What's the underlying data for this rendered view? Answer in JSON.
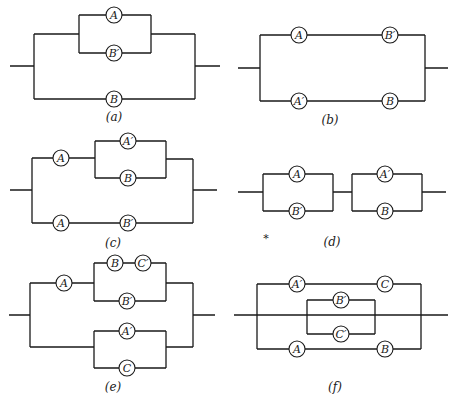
{
  "figure": {
    "stroke_color": "#1a1a1a",
    "background": "#ffffff"
  },
  "circuits": [
    {
      "id": "a",
      "caption": "(a)",
      "structure": "parallel( parallel(A, B'), B )",
      "switches": [
        {
          "label": "A",
          "x": 114,
          "y": 15
        },
        {
          "label": "B′",
          "x": 114,
          "y": 53
        },
        {
          "label": "B",
          "x": 114,
          "y": 99
        }
      ]
    },
    {
      "id": "b",
      "caption": "(b)",
      "structure": "parallel( series(A, B'), series(A', B) )",
      "switches": [
        {
          "label": "A",
          "x": 299,
          "y": 35
        },
        {
          "label": "B′",
          "x": 390,
          "y": 35
        },
        {
          "label": "A′",
          "x": 299,
          "y": 101
        },
        {
          "label": "B",
          "x": 390,
          "y": 101
        }
      ]
    },
    {
      "id": "c",
      "caption": "(c)",
      "structure": "parallel( series(A, parallel(A', B)), series(A, B') )",
      "switches": [
        {
          "label": "A",
          "x": 61,
          "y": 160
        },
        {
          "label": "A′",
          "x": 128,
          "y": 141
        },
        {
          "label": "B",
          "x": 128,
          "y": 178
        },
        {
          "label": "A",
          "x": 61,
          "y": 223
        },
        {
          "label": "B′",
          "x": 128,
          "y": 223
        }
      ]
    },
    {
      "id": "d",
      "caption": "(d)",
      "structure": "series( parallel(A, B'), parallel(A', B) )",
      "switches": [
        {
          "label": "A",
          "x": 297,
          "y": 174
        },
        {
          "label": "B′",
          "x": 297,
          "y": 211
        },
        {
          "label": "A′",
          "x": 385,
          "y": 174
        },
        {
          "label": "B",
          "x": 385,
          "y": 211
        }
      ],
      "annotation": "*"
    },
    {
      "id": "e",
      "caption": "(e)",
      "structure": "parallel( series(A, parallel(series(B, C'), B')), parallel(A', C) )",
      "switches": [
        {
          "label": "A",
          "x": 64,
          "y": 283
        },
        {
          "label": "B",
          "x": 115,
          "y": 263
        },
        {
          "label": "C′",
          "x": 143,
          "y": 263
        },
        {
          "label": "B′",
          "x": 127,
          "y": 301
        },
        {
          "label": "A′",
          "x": 127,
          "y": 331
        },
        {
          "label": "C",
          "x": 127,
          "y": 368
        }
      ]
    },
    {
      "id": "f",
      "caption": "(f)",
      "structure": "parallel( series(A', C), parallel(B', C'), series(A, B) )",
      "switches": [
        {
          "label": "A′",
          "x": 297,
          "y": 284
        },
        {
          "label": "C",
          "x": 385,
          "y": 284
        },
        {
          "label": "B′",
          "x": 341,
          "y": 300
        },
        {
          "label": "C′",
          "x": 341,
          "y": 334
        },
        {
          "label": "A",
          "x": 297,
          "y": 349
        },
        {
          "label": "B",
          "x": 385,
          "y": 349
        }
      ]
    }
  ]
}
